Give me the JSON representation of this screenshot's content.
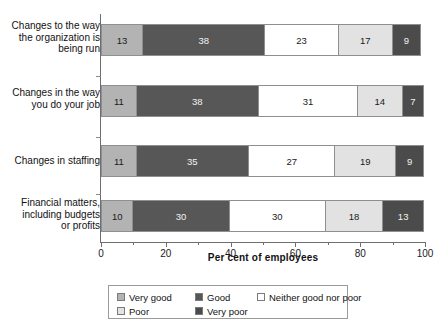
{
  "chart_data": {
    "type": "bar",
    "orientation": "horizontal",
    "stacked": true,
    "stacked_mode": "percent",
    "title": "",
    "xlabel": "Per cent of employees",
    "ylabel": "",
    "xlim": [
      0,
      100
    ],
    "xticks": [
      0,
      20,
      40,
      60,
      80,
      100
    ],
    "xtick_labels": [
      "0",
      "20",
      "40",
      "60",
      "80",
      "100"
    ],
    "minor_xticks": [
      10,
      30,
      50,
      70,
      90
    ],
    "grid": false,
    "legend_position": "bottom",
    "categories": [
      "Changes to the way the organization is being run",
      "Changes in the way you do your job",
      "Changes in staffing",
      "Financial matters, including budgets or profits"
    ],
    "category_label_lines": [
      [
        "Changes to the way",
        "the organization is",
        "being run"
      ],
      [
        "Changes in the way",
        "you do your job"
      ],
      [
        "Changes in staffing"
      ],
      [
        "Financial matters,",
        "including budgets",
        "or profits"
      ]
    ],
    "series": [
      {
        "name": "Very good",
        "color": "#b3b3b3",
        "values": [
          13,
          11,
          11,
          10
        ]
      },
      {
        "name": "Good",
        "color": "#575757",
        "values": [
          38,
          38,
          35,
          30
        ]
      },
      {
        "name": "Neither good nor poor",
        "color": "#ffffff",
        "values": [
          23,
          31,
          27,
          30
        ]
      },
      {
        "name": "Poor",
        "color": "#e2e2e2",
        "values": [
          17,
          14,
          19,
          18
        ]
      },
      {
        "name": "Very poor",
        "color": "#4b4b4b",
        "values": [
          9,
          7,
          9,
          13
        ]
      }
    ],
    "data_labels": [
      [
        "13",
        "38",
        "23",
        "17",
        "9"
      ],
      [
        "11",
        "38",
        "31",
        "14",
        "7"
      ],
      [
        "11",
        "35",
        "27",
        "19",
        "9"
      ],
      [
        "10",
        "30",
        "30",
        "18",
        "13"
      ]
    ]
  },
  "legend": {
    "rows": [
      [
        {
          "label": "Very good",
          "swatch": "s0"
        },
        {
          "label": "Good",
          "swatch": "s1"
        },
        {
          "label": "Neither good nor poor",
          "swatch": "s2"
        }
      ],
      [
        {
          "label": "Poor",
          "swatch": "s3"
        },
        {
          "label": "Very poor",
          "swatch": "s4"
        }
      ]
    ]
  }
}
